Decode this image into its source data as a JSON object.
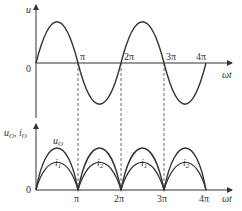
{
  "top_plot": {
    "y_label": "u",
    "x_label": "ωt",
    "origin": "0",
    "ticks": [
      "π",
      "2π",
      "3π",
      "4π"
    ]
  },
  "bottom_plot": {
    "y_label_u": "u",
    "y_label_u_sub": "O",
    "y_label_sep": ", ",
    "y_label_i": "i",
    "y_label_i_sub": "O",
    "x_label": "ωt",
    "origin": "0",
    "ticks": [
      "π",
      "2π",
      "3π",
      "4π"
    ],
    "curve_label_u": "u",
    "curve_label_u_sub": "O",
    "half_labels": [
      {
        "main": "i",
        "sub": "1"
      },
      {
        "main": "i",
        "sub": "2"
      },
      {
        "main": "i",
        "sub": "1"
      },
      {
        "main": "i",
        "sub": "2"
      }
    ]
  },
  "colors": {
    "stroke": "#333333",
    "dash": "#444444"
  }
}
